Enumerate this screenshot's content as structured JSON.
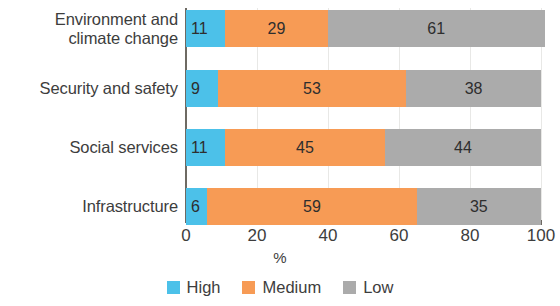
{
  "chart_data": {
    "type": "bar",
    "orientation": "horizontal",
    "stacked": true,
    "stack_mode": "percent",
    "title": "",
    "subtitle": "",
    "xlabel": "%",
    "ylabel": "",
    "xlim": [
      0,
      100
    ],
    "xticks": [
      0,
      20,
      40,
      60,
      80,
      100
    ],
    "xtick_labels": [
      "0",
      "20",
      "40",
      "60",
      "80",
      "100"
    ],
    "grid": true,
    "grid_axis": "x",
    "legend_position": "bottom",
    "categories": [
      "Environment and climate change",
      "Security and safety",
      "Social services",
      "Infrastructure"
    ],
    "category_lines": [
      [
        "Environment and",
        "climate change"
      ],
      [
        "Security and safety"
      ],
      [
        "Social services"
      ],
      [
        "Infrastructure"
      ]
    ],
    "series": [
      {
        "name": "High",
        "color": "#4CC1E9",
        "values": [
          11,
          9,
          11,
          6
        ]
      },
      {
        "name": "Medium",
        "color": "#F79B55",
        "values": [
          29,
          53,
          45,
          59
        ]
      },
      {
        "name": "Low",
        "color": "#ABABAB",
        "values": [
          61,
          38,
          44,
          35
        ]
      }
    ],
    "bars": [
      {
        "category": "Environment and climate change",
        "segments": [
          {
            "series": "High",
            "value": 11,
            "label": "11"
          },
          {
            "series": "Medium",
            "value": 29,
            "label": "29"
          },
          {
            "series": "Low",
            "value": 61,
            "label": "61"
          }
        ]
      },
      {
        "category": "Security and safety",
        "segments": [
          {
            "series": "High",
            "value": 9,
            "label": "9"
          },
          {
            "series": "Medium",
            "value": 53,
            "label": "53"
          },
          {
            "series": "Low",
            "value": 38,
            "label": "38"
          }
        ]
      },
      {
        "category": "Social services",
        "segments": [
          {
            "series": "High",
            "value": 11,
            "label": "11"
          },
          {
            "series": "Medium",
            "value": 45,
            "label": "45"
          },
          {
            "series": "Low",
            "value": 44,
            "label": "44"
          }
        ]
      },
      {
        "category": "Infrastructure",
        "segments": [
          {
            "series": "High",
            "value": 6,
            "label": "6"
          },
          {
            "series": "Medium",
            "value": 59,
            "label": "59"
          },
          {
            "series": "Low",
            "value": 35,
            "label": "35"
          }
        ]
      }
    ],
    "legend": [
      {
        "label": "High",
        "color": "#4CC1E9"
      },
      {
        "label": "Medium",
        "color": "#F79B55"
      },
      {
        "label": "Low",
        "color": "#ABABAB"
      }
    ]
  },
  "colors": {
    "high": "#4CC1E9",
    "medium": "#F79B55",
    "low": "#ABABAB",
    "axis": "#6E6A63",
    "grid": "#E8E8E6",
    "text": "#3D3D3D",
    "background": "#FFFFFF"
  }
}
